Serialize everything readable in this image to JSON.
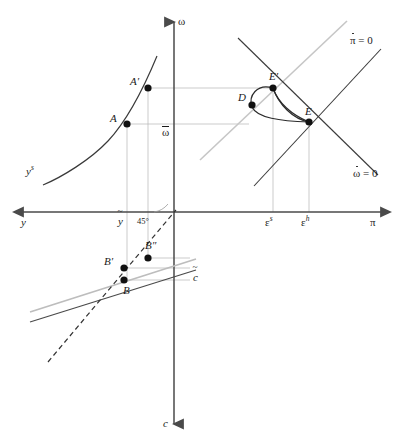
{
  "figure": {
    "background_color": "#ffffff",
    "width": 403,
    "height": 443
  },
  "axes": {
    "vertical": {
      "top_label": "ω",
      "bottom_label": "c",
      "x": 174,
      "top_y": 14,
      "bottom_y": 432
    },
    "horizontal": {
      "left_label": "y",
      "right_label": "π",
      "y": 212,
      "left_x": 8,
      "right_x": 396
    }
  },
  "labels": {
    "omega_axis": "ω",
    "c_axis": "c",
    "y_axis": "y",
    "pi_axis": "π",
    "omega_bar": "ω",
    "c_tilde": "c",
    "y_tilde": "y",
    "ys_curve": "y",
    "ys_sup": "s",
    "angle45": "45",
    "angle_deg": "°",
    "epsilon_s": "ε",
    "epsilon_s_sup": "s",
    "epsilon_h": "ε",
    "epsilon_h_sup": "h",
    "pi_dot_zero_sym": "π",
    "pi_dot_zero_eq": " = 0",
    "omega_dot_zero_sym": "ω",
    "omega_dot_zero_eq": " = 0"
  },
  "points": [
    {
      "id": "A",
      "label": "A",
      "x": 127,
      "y": 124,
      "label_dx": -16,
      "label_dy": -5
    },
    {
      "id": "Ap",
      "label": "A′",
      "x": 148,
      "y": 88,
      "label_dx": -17,
      "label_dy": -8
    },
    {
      "id": "B",
      "label": "B",
      "x": 124,
      "y": 280,
      "label_dx": 1,
      "label_dy": 13
    },
    {
      "id": "Bp",
      "label": "B′",
      "x": 124,
      "y": 268,
      "label_dx": -18,
      "label_dy": -8
    },
    {
      "id": "Bpp",
      "label": "B″",
      "x": 148,
      "y": 258,
      "label_dx": -4,
      "label_dy": -12
    },
    {
      "id": "D",
      "label": "D",
      "x": 262,
      "y": 105,
      "label_dx": -13,
      "label_dy": -6
    },
    {
      "id": "E",
      "label": "E",
      "x": 309,
      "y": 122,
      "label_dx": -4,
      "label_dy": -10
    },
    {
      "id": "Ep",
      "label": "E′",
      "x": 273,
      "y": 88,
      "label_dx": -2,
      "label_dy": -11
    }
  ],
  "curves": {
    "ys_supply": {
      "name": "output supply curve",
      "color": "#3a3a3a",
      "path": "M 43,185 C 62,177 90,160 108,141 C 124,124 140,97 157,56"
    },
    "pi_dot_zero_line": {
      "name": "pi-dot equals zero locus",
      "color": "#3a3a3a",
      "path": "M 254,186 L 381,49"
    },
    "omega_dot_zero_line": {
      "name": "omega-dot equals zero locus",
      "color": "#3a3a3a",
      "path": "M 216,41 L 358,180"
    },
    "gray_ray_45": {
      "name": "gray reference ray",
      "color": "#c0c0c0",
      "path": "M 200,160 L 347,21"
    },
    "traj_outer": {
      "name": "trajectory E to E-prime outer arc",
      "color": "#2b2b2b",
      "path": "M 309,122 C 296,116 282,104 273,88"
    },
    "traj_inner": {
      "name": "trajectory E-prime to D to E loop",
      "color": "#2b2b2b",
      "path": "M 273,88 C 258,84 250,96 253,106 C 256,116 277,120 309,122"
    },
    "traj_d_link": {
      "name": "trajectory arc through D to E",
      "color": "#2b2b2b",
      "path": "M 273,88 C 276,104 292,116 309,122"
    },
    "consumption_dark": {
      "name": "consumption function dark line",
      "color": "#4a4a4a",
      "path": "M 30,322 L 196,270"
    },
    "consumption_gray": {
      "name": "consumption function gray line",
      "color": "#bdbdbd",
      "path": "M 30,312 L 196,259"
    },
    "line45_dashed": {
      "name": "45 degree dashed line",
      "color": "#333333",
      "path": "M 48,360 L 174,212"
    }
  },
  "guides": {
    "color": "#b5b5b5",
    "segments": [
      {
        "name": "A-horizontal",
        "x1": 127,
        "y1": 124,
        "x2": 249,
        "y2": 124
      },
      {
        "name": "Ap-horizontal",
        "x1": 148,
        "y1": 88,
        "x2": 273,
        "y2": 88
      },
      {
        "name": "A-vertical",
        "x1": 127,
        "y1": 124,
        "x2": 127,
        "y2": 280
      },
      {
        "name": "Ap-vertical",
        "x1": 148,
        "y1": 88,
        "x2": 148,
        "y2": 258
      },
      {
        "name": "epsilon-s-vertical",
        "x1": 273,
        "y1": 88,
        "x2": 273,
        "y2": 212
      },
      {
        "name": "epsilon-h-vertical",
        "x1": 309,
        "y1": 122,
        "x2": 309,
        "y2": 212
      },
      {
        "name": "B-horizontal",
        "x1": 124,
        "y1": 280,
        "x2": 190,
        "y2": 280
      },
      {
        "name": "Bp-horizontal",
        "x1": 124,
        "y1": 268,
        "x2": 190,
        "y2": 268
      },
      {
        "name": "Bpp-horizontal",
        "x1": 148,
        "y1": 258,
        "x2": 190,
        "y2": 258
      }
    ]
  },
  "tick_labels": [
    {
      "name": "y-tilde",
      "x": 119,
      "y": 216
    },
    {
      "name": "epsilon-s",
      "x": 266,
      "y": 216
    },
    {
      "name": "epsilon-h",
      "x": 302,
      "y": 216
    },
    {
      "name": "omega-bar",
      "x": 163,
      "y": 127
    },
    {
      "name": "c-tilde",
      "x": 193,
      "y": 272
    }
  ]
}
